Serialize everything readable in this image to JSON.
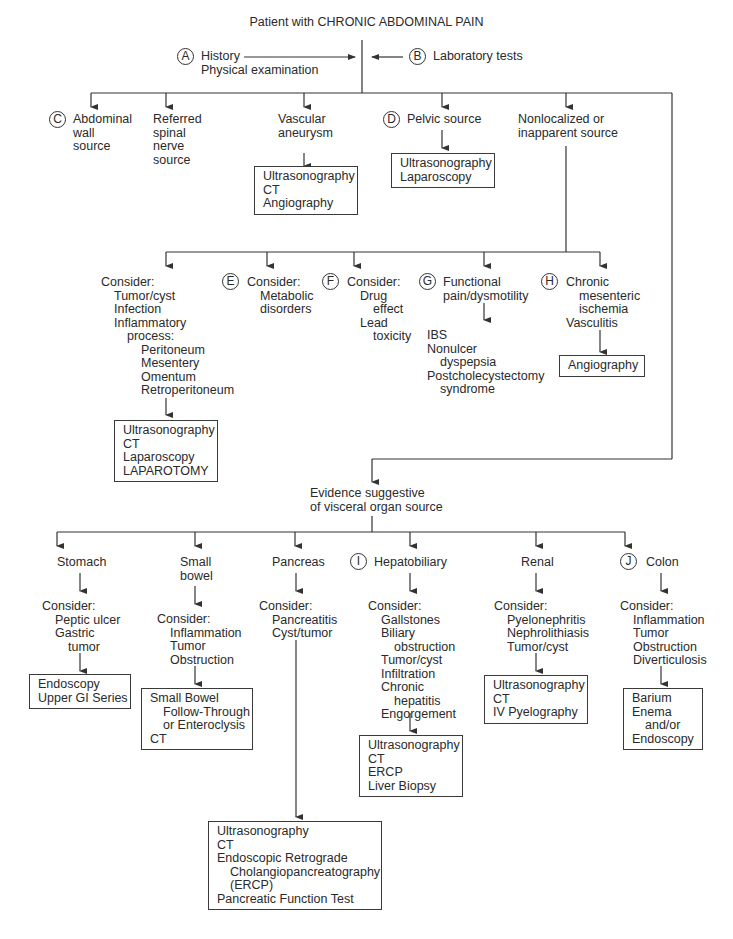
{
  "title": "Patient with CHRONIC ABDOMINAL PAIN",
  "inputs": {
    "history": {
      "badge": "A",
      "lines": [
        "History",
        "Physical examination"
      ]
    },
    "labs": {
      "badge": "B",
      "label": "Laboratory tests"
    }
  },
  "level1": {
    "abdominal_wall": {
      "badge": "C",
      "lines": [
        "Abdominal",
        "wall",
        "source"
      ]
    },
    "referred": {
      "lines": [
        "Referred",
        "spinal",
        "nerve",
        "source"
      ]
    },
    "vascular": {
      "lines": [
        "Vascular",
        "aneurysm"
      ],
      "tests": [
        "Ultrasonography",
        "CT",
        "Angiography"
      ]
    },
    "pelvic": {
      "badge": "D",
      "label": "Pelvic source",
      "tests": [
        "Ultrasonography",
        "Laparoscopy"
      ]
    },
    "nonlocalized": {
      "lines": [
        "Nonlocalized or",
        "inapparent source"
      ]
    }
  },
  "level2": {
    "consider_general": {
      "lines": [
        "Consider:",
        "Tumor/cyst",
        "Infection",
        "Inflammatory",
        "process:",
        "Peritoneum",
        "Mesentery",
        "Omentum",
        "Retroperitoneum"
      ],
      "tests": [
        "Ultrasonography",
        "CT",
        "Laparoscopy",
        "LAPAROTOMY"
      ]
    },
    "metabolic": {
      "badge": "E",
      "lines": [
        "Consider:",
        "Metabolic",
        "disorders"
      ]
    },
    "drug": {
      "badge": "F",
      "lines": [
        "Consider:",
        "Drug",
        "effect",
        "Lead",
        "toxicity"
      ]
    },
    "functional": {
      "badge": "G",
      "lines": [
        "Functional",
        "pain/dysmotility"
      ],
      "results": [
        "IBS",
        "Nonulcer",
        "dyspepsia",
        "Postcholecystectomy",
        "syndrome"
      ]
    },
    "ischemia": {
      "badge": "H",
      "lines": [
        "Chronic",
        "mesenteric",
        "ischemia",
        "Vasculitis"
      ],
      "tests": [
        "Angiography"
      ]
    }
  },
  "evidence": {
    "lines": [
      "Evidence suggestive",
      "of visceral organ source"
    ]
  },
  "organs": {
    "stomach": {
      "label": "Stomach",
      "consider": [
        "Consider:",
        "Peptic ulcer",
        "Gastric",
        "tumor"
      ],
      "tests": [
        "Endoscopy",
        "Upper GI Series"
      ]
    },
    "small_bowel": {
      "lines": [
        "Small",
        "bowel"
      ],
      "consider": [
        "Consider:",
        "Inflammation",
        "Tumor",
        "Obstruction"
      ],
      "tests": [
        "Small Bowel",
        "Follow-Through",
        "or Enteroclysis",
        "CT"
      ]
    },
    "pancreas": {
      "label": "Pancreas",
      "consider": [
        "Consider:",
        "Pancreatitis",
        "Cyst/tumor"
      ],
      "tests": [
        "Ultrasonography",
        "CT",
        "Endoscopic Retrograde",
        "Cholangiopancreatography",
        "(ERCP)",
        "Pancreatic Function Test"
      ]
    },
    "hepatobiliary": {
      "badge": "I",
      "label": "Hepatobiliary",
      "consider": [
        "Consider:",
        "Gallstones",
        "Biliary",
        "obstruction",
        "Tumor/cyst",
        "Infiltration",
        "Chronic",
        "hepatitis",
        "Engorgement"
      ],
      "tests": [
        "Ultrasonography",
        "CT",
        "ERCP",
        "Liver Biopsy"
      ]
    },
    "renal": {
      "label": "Renal",
      "consider": [
        "Consider:",
        "Pyelonephritis",
        "Nephrolithiasis",
        "Tumor/cyst"
      ],
      "tests": [
        "Ultrasonography",
        "CT",
        "IV Pyelography"
      ]
    },
    "colon": {
      "badge": "J",
      "label": "Colon",
      "consider": [
        "Consider:",
        "Inflammation",
        "Tumor",
        "Obstruction",
        "Diverticulosis"
      ],
      "tests": [
        "Barium",
        "Enema",
        "and/or",
        "Endoscopy"
      ]
    }
  },
  "colors": {
    "line": "#333333",
    "text": "#2a2a2a",
    "background": "#ffffff"
  }
}
